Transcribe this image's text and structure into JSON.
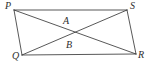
{
  "figure": {
    "background_color": "#ffffff",
    "line_color": "#3a3a3a",
    "label_color": "#2e2e2e",
    "labels": {
      "p": "P",
      "s": "S",
      "q": "Q",
      "r": "R",
      "a": "A",
      "b": "B"
    }
  },
  "chart_data": {
    "type": "diagram",
    "points": [
      {
        "name": "P",
        "x": 14,
        "y": 10,
        "label": "P",
        "label_x": 5,
        "label_y": 1
      },
      {
        "name": "S",
        "x": 127,
        "y": 10,
        "label": "S",
        "label_x": 130,
        "label_y": 1
      },
      {
        "name": "R",
        "x": 136,
        "y": 54,
        "label": "R",
        "label_x": 138,
        "label_y": 50
      },
      {
        "name": "Q",
        "x": 22,
        "y": 55,
        "label": "Q",
        "label_x": 12,
        "label_y": 51
      },
      {
        "name": "A",
        "x": 66,
        "y": 28,
        "label": "A",
        "label_x": 63,
        "label_y": 16
      },
      {
        "name": "B",
        "x": 70,
        "y": 48,
        "label": "B",
        "label_x": 66,
        "label_y": 40
      }
    ],
    "segments": [
      {
        "name": "PS",
        "from": "P",
        "to": "S"
      },
      {
        "name": "SR",
        "from": "S",
        "to": "R"
      },
      {
        "name": "RQ",
        "from": "R",
        "to": "Q"
      },
      {
        "name": "QP",
        "from": "Q",
        "to": "P"
      },
      {
        "name": "PR",
        "from": "P",
        "to": "R"
      },
      {
        "name": "QS",
        "from": "Q",
        "to": "S"
      }
    ]
  }
}
